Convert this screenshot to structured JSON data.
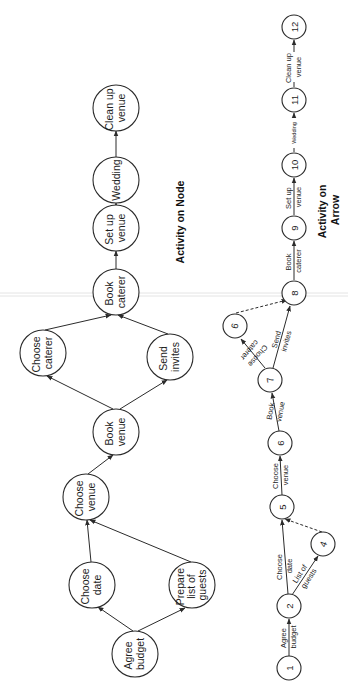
{
  "orientation": "rotated -90 degrees (text reads bottom-to-top)",
  "colors": {
    "background": "#ffffff",
    "stroke": "#2b2b2b",
    "text": "#1e1e1e"
  },
  "activity_on_node": {
    "title": "Activity on Node",
    "nodes": [
      {
        "id": "agree_budget",
        "lines": [
          "Agree",
          "budget"
        ]
      },
      {
        "id": "choose_date",
        "lines": [
          "Choose",
          "date"
        ]
      },
      {
        "id": "prepare_list",
        "lines": [
          "Prepare",
          "list of",
          "guests"
        ]
      },
      {
        "id": "choose_venue",
        "lines": [
          "Choose",
          "venue"
        ]
      },
      {
        "id": "book_venue",
        "lines": [
          "Book",
          "venue"
        ]
      },
      {
        "id": "choose_caterer",
        "lines": [
          "Choose",
          "caterer"
        ]
      },
      {
        "id": "send_invites",
        "lines": [
          "Send",
          "invites"
        ]
      },
      {
        "id": "book_caterer",
        "lines": [
          "Book",
          "caterer"
        ]
      },
      {
        "id": "set_up_venue",
        "lines": [
          "Set up",
          "venue"
        ]
      },
      {
        "id": "wedding",
        "lines": [
          "Wedding"
        ]
      },
      {
        "id": "clean_up_venue",
        "lines": [
          "Clean up",
          "venue"
        ]
      }
    ],
    "edges": [
      [
        "agree_budget",
        "choose_date"
      ],
      [
        "agree_budget",
        "prepare_list"
      ],
      [
        "choose_date",
        "choose_venue"
      ],
      [
        "prepare_list",
        "choose_venue"
      ],
      [
        "choose_venue",
        "book_venue"
      ],
      [
        "book_venue",
        "choose_caterer"
      ],
      [
        "book_venue",
        "send_invites"
      ],
      [
        "choose_caterer",
        "book_caterer"
      ],
      [
        "send_invites",
        "book_caterer"
      ],
      [
        "book_caterer",
        "set_up_venue"
      ],
      [
        "set_up_venue",
        "wedding"
      ],
      [
        "wedding",
        "clean_up_venue"
      ]
    ]
  },
  "activity_on_arrow": {
    "title_line1": "Activity on",
    "title_line2": "Arrow",
    "nodes": [
      "1",
      "2",
      "4",
      "5",
      "6",
      "7",
      "9",
      "8",
      "9",
      "10",
      "11",
      "12"
    ],
    "activities": [
      {
        "from": "1",
        "to": "2",
        "lines": [
          "Agree",
          "budget"
        ]
      },
      {
        "from": "2",
        "to": "5",
        "lines": [
          "Choose",
          "date"
        ]
      },
      {
        "from": "2",
        "to": "4",
        "lines": [
          "List of",
          "guests"
        ]
      },
      {
        "from": "4",
        "to": "5",
        "dummy": true
      },
      {
        "from": "5",
        "to": "6",
        "lines": [
          "Choose",
          "venue"
        ]
      },
      {
        "from": "6",
        "to": "7",
        "lines": [
          "Book",
          "venue"
        ]
      },
      {
        "from": "7",
        "to": "9",
        "lines": [
          "Choose",
          "caterer"
        ]
      },
      {
        "from": "7",
        "to": "8",
        "lines": [
          "Send",
          "invites"
        ]
      },
      {
        "from": "9",
        "to": "8",
        "dummy": true
      },
      {
        "from": "8",
        "to": "9",
        "lines": [
          "Book",
          "caterer"
        ]
      },
      {
        "from": "9",
        "to": "10",
        "lines": [
          "Set up",
          "venue"
        ]
      },
      {
        "from": "10",
        "to": "11",
        "lines": [
          "Wedding"
        ]
      },
      {
        "from": "11",
        "to": "12",
        "lines": [
          "Clean up",
          "venue"
        ]
      }
    ]
  }
}
